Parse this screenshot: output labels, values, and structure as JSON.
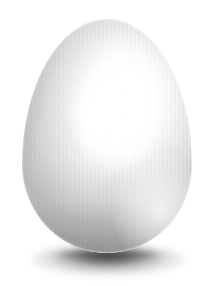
{
  "scene": {
    "title": "Egg",
    "background_color": "#ffffff",
    "width": 216,
    "height": 286
  },
  "subject": {
    "name": "egg",
    "description": "White chicken egg, three-dimensional render",
    "surface_texture": "fine vertical stripes",
    "base_color": "#e9e9e9",
    "highlight_color": "#ffffff",
    "shadow_side_color": "#a8a8a8",
    "position": {
      "left": 22,
      "top": 19,
      "width": 170,
      "height": 234
    },
    "light_direction": "upper-right"
  },
  "shadow": {
    "name": "drop-shadow",
    "color": "#606060",
    "position": {
      "left": 30,
      "top": 244,
      "width": 156,
      "height": 32
    },
    "shape": "ellipse",
    "blur": "soft"
  }
}
